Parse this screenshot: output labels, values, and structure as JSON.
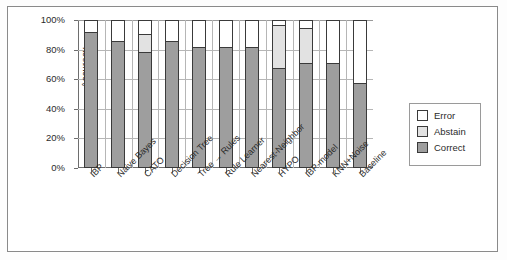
{
  "chart_data": {
    "type": "bar",
    "subtype": "stacked-bar-100-percent",
    "title": "",
    "xlabel": "",
    "ylabel": "Accuracy",
    "ylim": [
      0,
      100
    ],
    "ytick_labels": [
      "100%",
      "80%",
      "60%",
      "40%",
      "20%",
      "0%"
    ],
    "ytick_values": [
      100,
      80,
      60,
      40,
      20,
      0
    ],
    "grid": "horizontal-and-vertical",
    "legend_position": "right-outside",
    "categories": [
      "IBP",
      "Naive Bayes",
      "CATO",
      "Decision Tree",
      "Tree → Rules",
      "Rule Learner",
      "Nearest-Neighbor",
      "HYPO",
      "IBP-model",
      "KNN+Noise",
      "Baseline"
    ],
    "series": [
      {
        "name": "Correct",
        "color": "#9e9e9e",
        "values": [
          91,
          85,
          78,
          85,
          81,
          81,
          81,
          67,
          70,
          70,
          57
        ]
      },
      {
        "name": "Abstain",
        "color": "#e2e2e2",
        "values": [
          0,
          0,
          12,
          0,
          0,
          0,
          0,
          29,
          24,
          0,
          0
        ]
      },
      {
        "name": "Error",
        "color": "#ffffff",
        "values": [
          9,
          15,
          10,
          15,
          19,
          19,
          19,
          4,
          6,
          30,
          43
        ]
      }
    ],
    "legend": [
      {
        "label": "Error",
        "color": "#ffffff"
      },
      {
        "label": "Abstain",
        "color": "#e2e2e2"
      },
      {
        "label": "Correct",
        "color": "#9e9e9e"
      }
    ]
  }
}
